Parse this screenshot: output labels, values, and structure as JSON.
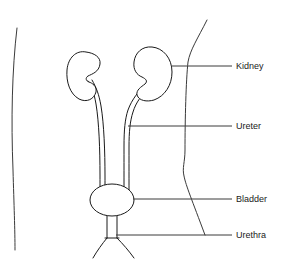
{
  "diagram": {
    "background_color": "#ffffff",
    "line_color": "#1a1a1a",
    "outline_color": "#3a3a3a",
    "width": 287,
    "height": 266
  },
  "labels": [
    {
      "id": "kidney",
      "text": "Kidney",
      "icon": "leader-line-icon",
      "text_x": 236,
      "text_y": 67,
      "leader_x1": 172,
      "leader_x2": 232,
      "leader_y": 66
    },
    {
      "id": "ureter",
      "text": "Ureter",
      "icon": "leader-line-icon",
      "text_x": 236,
      "text_y": 127,
      "leader_x1": 128,
      "leader_x2": 232,
      "leader_y": 126
    },
    {
      "id": "bladder",
      "text": "Bladder",
      "icon": "leader-line-icon",
      "text_x": 236,
      "text_y": 200,
      "leader_x1": 133,
      "leader_x2": 232,
      "leader_y": 199
    },
    {
      "id": "urethra",
      "text": "Urethra",
      "icon": "leader-line-icon",
      "text_x": 236,
      "text_y": 236,
      "leader_x1": 116,
      "leader_x2": 232,
      "leader_y": 235
    }
  ],
  "anatomy": {
    "body_outline_left": "M 17,28 C 12,70 11,120 13,170 C 14,205 15,230 15,250",
    "body_outline_right": "M 207,20 C 198,38 190,50 188,62 C 186,80 185,120 185,150 C 185,162 182,168 184,176 C 186,186 192,200 205,235",
    "left_kidney": "M 86,52 C 76,50 68,58 67,70 C 66,82 70,94 79,99 C 87,103 94,99 96,92 C 97,86 92,83 89,82 C 86,81 85,78 88,76 C 92,74 99,72 100,64 C 101,57 94,53 86,52 Z",
    "right_kidney": "M 152,47 C 142,46 135,53 134,62 C 133,70 137,75 142,77 C 146,79 148,81 145,84 C 141,87 136,90 137,95 C 139,101 147,102 154,100 C 165,96 172,85 172,72 C 172,58 163,48 152,47 Z",
    "left_ureter_outer": "M 88,81 C 91,86 94,92 96,104 C 99,122 100,150 100,175 C 100,188 100,196 100,203",
    "left_ureter_inner": "M 92,80 C 96,87 99,94 101,106 C 104,124 105,152 105,176 C 105,189 105,197 105,203",
    "right_ureter_outer": "M 144,86 C 139,91 132,99 128,110 C 125,119 124,130 124,146 C 124,168 124,190 124,203",
    "right_ureter_inner": "M 147,90 C 142,95 136,102 133,112 C 130,121 129,132 129,147 C 129,169 129,191 129,203",
    "bladder": {
      "cx": 112,
      "cy": 200,
      "rx": 22,
      "ry": 16
    },
    "urethra_left": "M 107,216 L 107,238",
    "urethra_right": "M 117,216 L 117,238",
    "urethra_base": "M 105,238 L 119,238",
    "urethra_leg_left": "M 107,238 C 102,244 97,251 93,258",
    "urethra_leg_right": "M 117,238 C 123,244 129,251 134,258"
  }
}
